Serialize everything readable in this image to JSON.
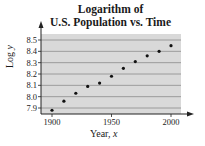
{
  "chart_data": {
    "type": "scatter",
    "title_lines": [
      "Logarithm of",
      "U.S. Population vs. Time"
    ],
    "xlabel": "Year, x",
    "xlabel_text": "Year, ",
    "xlabel_var": "x",
    "ylabel": "Log y",
    "ylabel_text": "Log ",
    "ylabel_var": "y",
    "x_ticks": [
      1900,
      1950,
      2000
    ],
    "y_ticks": [
      7.9,
      8.0,
      8.1,
      8.2,
      8.3,
      8.4,
      8.5
    ],
    "y_tick_labels": [
      "7.9",
      "8.0",
      "8.1",
      "8.2",
      "8.3",
      "8.4",
      "8.5"
    ],
    "xlim": [
      1900,
      2010
    ],
    "ylim": [
      7.87,
      8.52
    ],
    "grid": "horizontal",
    "legend": null,
    "x": [
      1900,
      1910,
      1920,
      1930,
      1940,
      1950,
      1960,
      1970,
      1980,
      1990,
      2000
    ],
    "y": [
      7.88,
      7.96,
      8.03,
      8.09,
      8.12,
      8.18,
      8.25,
      8.31,
      8.36,
      8.4,
      8.45
    ]
  },
  "colors": {
    "plot_background": "#d9d9d9",
    "gridline": "#8c8c8c",
    "point": "#111111",
    "axis": "#222222"
  }
}
